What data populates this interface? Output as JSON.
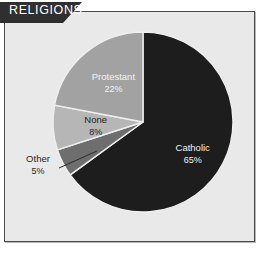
{
  "panel": {
    "title": "RELIGIONS",
    "background_color": "#e9e9e9",
    "border_color": "#4a4a4a",
    "banner_color": "#2f2f2f",
    "banner_text_color": "#ffffff"
  },
  "chart_data": {
    "type": "pie",
    "title": "RELIGIONS",
    "categories": [
      "Catholic",
      "Other",
      "None",
      "Protestant"
    ],
    "values": [
      65,
      8,
      5,
      22
    ],
    "value_unit": "%",
    "start_angle_deg": 0,
    "direction": "clockwise",
    "legend": "none",
    "grid": false,
    "slices": [
      {
        "label": "Catholic",
        "value": 65,
        "value_text": "65%",
        "color": "#1d1d1d",
        "label_color": "#f2f2f2",
        "label_placement": "inside"
      },
      {
        "label": "Other",
        "value": 5,
        "value_text": "5%",
        "color": "#6e6e6e",
        "label_color": "#1f1f1f",
        "label_placement": "outside-leader"
      },
      {
        "label": "None",
        "value": 8,
        "value_text": "8%",
        "color": "#b6b6b6",
        "label_color": "#1f1f1f",
        "label_placement": "inside"
      },
      {
        "label": "Protestant",
        "value": 22,
        "value_text": "22%",
        "color": "#a2a2a2",
        "label_color": "#f2f2f2",
        "label_placement": "inside"
      }
    ],
    "geometry": {
      "center_x": 143,
      "center_y": 122,
      "radius": 90
    }
  }
}
